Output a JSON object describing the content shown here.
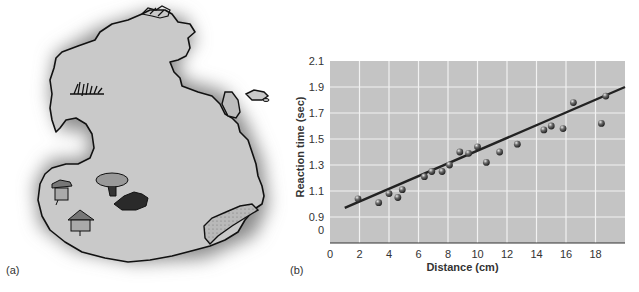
{
  "panels": {
    "a": {
      "label": "(a)"
    },
    "b": {
      "label": "(b)"
    }
  },
  "map": {
    "type": "illustrated-island-map",
    "land_color": "#c9c9c9",
    "shadow_color": "#8a8a8a",
    "outline_color": "#111111",
    "features": [
      {
        "name": "grass-tuft",
        "x": 85,
        "y": 90
      },
      {
        "name": "rocks-top",
        "x": 155,
        "y": 15
      },
      {
        "name": "hut-1",
        "x": 60,
        "y": 190
      },
      {
        "name": "tree",
        "x": 112,
        "y": 183
      },
      {
        "name": "dark-pond",
        "x": 133,
        "y": 200
      },
      {
        "name": "hut-2",
        "x": 80,
        "y": 220
      },
      {
        "name": "peninsula-beach",
        "x": 235,
        "y": 222
      }
    ]
  },
  "chart_data": {
    "type": "scatter",
    "title": "",
    "xlabel": "Distance (cm)",
    "ylabel": "Reaction time (sec)",
    "x_ticks": [
      "0",
      "2",
      "4",
      "6",
      "8",
      "10",
      "12",
      "14",
      "16",
      "18"
    ],
    "y_ticks": [
      "0",
      "0.9",
      "1.1",
      "1.3",
      "1.5",
      "1.7",
      "1.9",
      "2.1"
    ],
    "xlim": [
      0,
      20
    ],
    "ylim": [
      0.7,
      2.1
    ],
    "y_axis_break": "bottom tick labeled 0 sits where 0.7 would be",
    "grid": true,
    "plot_background": "#c4c4c4",
    "grid_color": "#f2f2f2",
    "marker_color": "#555555",
    "line_color": "#222222",
    "points": [
      {
        "x": 1.9,
        "y": 1.04
      },
      {
        "x": 3.3,
        "y": 1.01
      },
      {
        "x": 4.0,
        "y": 1.08
      },
      {
        "x": 4.6,
        "y": 1.05
      },
      {
        "x": 4.9,
        "y": 1.11
      },
      {
        "x": 6.4,
        "y": 1.21
      },
      {
        "x": 6.9,
        "y": 1.25
      },
      {
        "x": 7.6,
        "y": 1.25
      },
      {
        "x": 8.1,
        "y": 1.3
      },
      {
        "x": 8.8,
        "y": 1.4
      },
      {
        "x": 9.4,
        "y": 1.39
      },
      {
        "x": 10.0,
        "y": 1.44
      },
      {
        "x": 10.6,
        "y": 1.32
      },
      {
        "x": 11.5,
        "y": 1.4
      },
      {
        "x": 12.7,
        "y": 1.46
      },
      {
        "x": 14.5,
        "y": 1.57
      },
      {
        "x": 15.0,
        "y": 1.6
      },
      {
        "x": 15.8,
        "y": 1.58
      },
      {
        "x": 16.5,
        "y": 1.78
      },
      {
        "x": 18.4,
        "y": 1.62
      },
      {
        "x": 18.7,
        "y": 1.83
      }
    ],
    "trendline": {
      "x1": 1.0,
      "y1": 0.97,
      "x2": 20.0,
      "y2": 1.9
    }
  }
}
